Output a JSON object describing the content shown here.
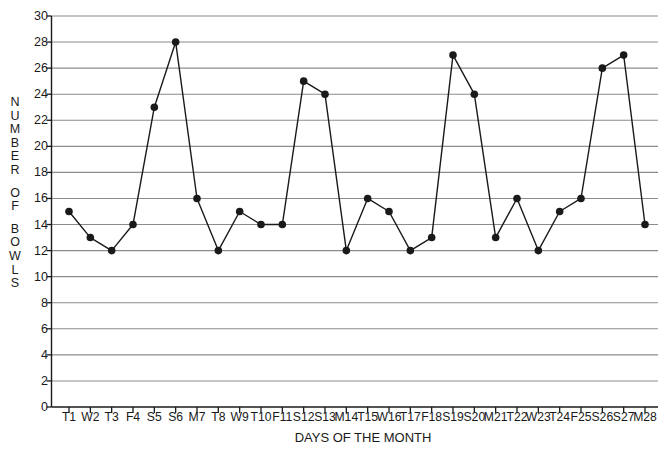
{
  "chart_data": {
    "type": "line",
    "title": "",
    "xlabel": "DAYS OF THE MONTH",
    "ylabel": "NUMBER OF BOWLS",
    "ylabel_stacked": [
      "N",
      "U",
      "M",
      "B",
      "E",
      "R",
      "",
      "O",
      "F",
      "",
      "B",
      "O",
      "W",
      "L",
      "S"
    ],
    "categories": [
      "T1",
      "W2",
      "T3",
      "F4",
      "S5",
      "S6",
      "M7",
      "T8",
      "W9",
      "T10",
      "F11",
      "S12",
      "S13",
      "M14",
      "T15",
      "W16",
      "T17",
      "F18",
      "S19",
      "S20",
      "M21",
      "T22",
      "W23",
      "T24",
      "F25",
      "S26",
      "S27",
      "M28"
    ],
    "values": [
      15,
      13,
      12,
      14,
      23,
      28,
      16,
      12,
      15,
      14,
      14,
      25,
      24,
      12,
      16,
      15,
      12,
      13,
      27,
      24,
      13,
      16,
      12,
      15,
      16,
      26,
      27,
      14
    ],
    "ylim": [
      0,
      30
    ],
    "y_tick_step": 2,
    "y_ticks": [
      0,
      2,
      4,
      6,
      8,
      10,
      12,
      14,
      16,
      18,
      20,
      22,
      24,
      26,
      28,
      30
    ],
    "grid": true,
    "grid_axis": "y",
    "legend": "none",
    "marker": "filled-circle",
    "line_color": "#1a1a1a",
    "marker_color": "#1a1a1a",
    "grid_color": "#8c8c8c",
    "axis_color": "#1a1a1a",
    "background_color": "#ffffff"
  }
}
